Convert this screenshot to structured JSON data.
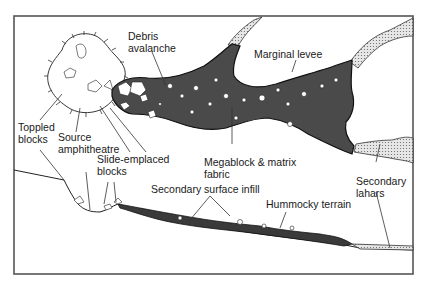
{
  "figure": {
    "type": "geologic-diagram",
    "colors": {
      "deposit_fill": "#4a4a4a",
      "lahar_fill": "#d8d8d8",
      "frame": "#555555",
      "background": "#ffffff"
    }
  },
  "labels": {
    "debris_avalanche": [
      "Debris",
      "avalanche"
    ],
    "marginal_levee": "Marginal levee",
    "toppled_blocks": [
      "Toppled",
      "blocks"
    ],
    "source_amphitheatre": [
      "Source",
      "amphitheatre"
    ],
    "slide_emplaced_blocks": [
      "Slide-emplaced",
      "blocks"
    ],
    "megablock_matrix": [
      "Megablock & matrix",
      "fabric"
    ],
    "secondary_surface_infill": "Secondary surface infill",
    "hummocky_terrain": "Hummocky terrain",
    "secondary_lahars": [
      "Secondary",
      "lahars"
    ]
  }
}
